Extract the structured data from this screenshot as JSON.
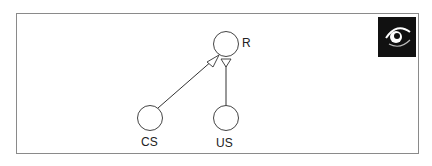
{
  "diagram": {
    "nodes": [
      {
        "id": "R",
        "label": "R"
      },
      {
        "id": "CS",
        "label": "CS"
      },
      {
        "id": "US",
        "label": "US"
      }
    ],
    "edges": [
      {
        "from": "CS",
        "to": "R",
        "arrow": "open-triangle"
      },
      {
        "from": "US",
        "to": "R",
        "arrow": "open-triangle"
      }
    ],
    "icon": "eye-icon",
    "colors": {
      "line": "#333333",
      "icon_bg": "#111111",
      "icon_fg": "#ffffff"
    }
  }
}
